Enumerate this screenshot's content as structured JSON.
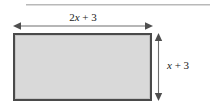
{
  "figure": {
    "type": "geometry-diagram",
    "shape": "rectangle",
    "background_color": "#ffffff",
    "fill_color": "#d9d9d9",
    "border_color": "#4a4a4a",
    "arrow_color": "#6f6f6f",
    "label_color": "#1a1a1a",
    "rule_color": "#b9b9b9"
  },
  "width_dimension": {
    "name": "width",
    "expression": "2x + 3",
    "coefficient": "2",
    "variable": "x",
    "operator": "+",
    "constant": "3",
    "position": "top",
    "arrow": "double-headed-horizontal"
  },
  "height_dimension": {
    "name": "height",
    "expression": "x + 3",
    "coefficient": "",
    "variable": "x",
    "operator": "+",
    "constant": "3",
    "position": "right",
    "arrow": "double-headed-vertical"
  }
}
